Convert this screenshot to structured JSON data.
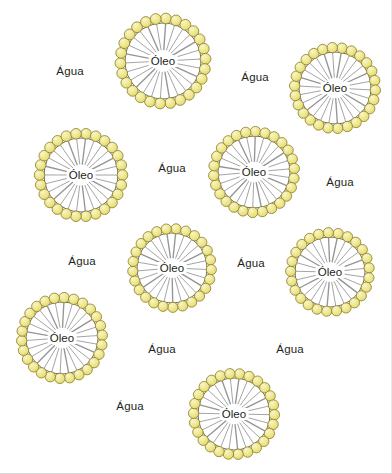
{
  "figure": {
    "background_color": "#ffffff",
    "text_color": "#231f20",
    "head_fill_color": "#ede78a",
    "head_highlight_color": "#f6f2bd",
    "head_stroke_color": "#8a7c2a",
    "tail_color": "#8d8d8d",
    "core_stroke_color": "#6e6e6e"
  },
  "legend_terms": {
    "oil": "Óleo",
    "water": "Água"
  },
  "micelles": [
    {
      "id": "micelle-1",
      "label": "Óleo",
      "cx": 163,
      "cy": 61,
      "core_r": 38,
      "head_r": 5.4,
      "head_count": 26,
      "angle_offset": 4
    },
    {
      "id": "micelle-2",
      "label": "Óleo",
      "cx": 335,
      "cy": 88,
      "core_r": 36,
      "head_r": 5.2,
      "head_count": 26,
      "angle_offset": 10
    },
    {
      "id": "micelle-3",
      "label": "Óleo",
      "cx": 81,
      "cy": 175,
      "core_r": 37,
      "head_r": 5.3,
      "head_count": 26,
      "angle_offset": 7
    },
    {
      "id": "micelle-4",
      "label": "Óleo",
      "cx": 254,
      "cy": 172,
      "core_r": 36,
      "head_r": 5.2,
      "head_count": 26,
      "angle_offset": 2
    },
    {
      "id": "micelle-5",
      "label": "Óleo",
      "cx": 172,
      "cy": 268,
      "core_r": 35,
      "head_r": 5.1,
      "head_count": 25,
      "angle_offset": 6
    },
    {
      "id": "micelle-6",
      "label": "Óleo",
      "cx": 330,
      "cy": 272,
      "core_r": 35,
      "head_r": 5.1,
      "head_count": 25,
      "angle_offset": 12
    },
    {
      "id": "micelle-7",
      "label": "Óleo",
      "cx": 62,
      "cy": 338,
      "core_r": 36,
      "head_r": 5.2,
      "head_count": 26,
      "angle_offset": 3
    },
    {
      "id": "micelle-8",
      "label": "Óleo",
      "cx": 234,
      "cy": 414,
      "core_r": 36,
      "head_r": 5.2,
      "head_count": 26,
      "angle_offset": 8
    }
  ],
  "water_labels": [
    {
      "id": "water-1",
      "text": "Água",
      "x": 70,
      "y": 71
    },
    {
      "id": "water-2",
      "text": "Água",
      "x": 255,
      "y": 77
    },
    {
      "id": "water-3",
      "text": "Água",
      "x": 172,
      "y": 168
    },
    {
      "id": "water-4",
      "text": "Água",
      "x": 340,
      "y": 182
    },
    {
      "id": "water-5",
      "text": "Água",
      "x": 82,
      "y": 261
    },
    {
      "id": "water-6",
      "text": "Água",
      "x": 251,
      "y": 263
    },
    {
      "id": "water-7",
      "text": "Água",
      "x": 162,
      "y": 349
    },
    {
      "id": "water-8",
      "text": "Água",
      "x": 290,
      "y": 349
    },
    {
      "id": "water-9",
      "text": "Água",
      "x": 130,
      "y": 406
    }
  ]
}
